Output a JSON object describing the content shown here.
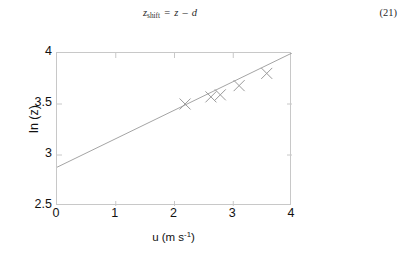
{
  "equation": {
    "variable": "z",
    "subscript": "shift",
    "equals": "=",
    "rhs_left": "z",
    "operator": "–",
    "rhs_right": "d",
    "full_text": "z_shift = z – d",
    "number": "(21)"
  },
  "chart_data": {
    "type": "scatter",
    "title": "",
    "xlabel": "u (m s-1)",
    "xlabel_base": "u (m s",
    "xlabel_exponent": "-1",
    "xlabel_tail": ")",
    "ylabel": "ln (z)",
    "xlim": [
      0,
      4
    ],
    "ylim": [
      2.5,
      4
    ],
    "xticks": [
      "0",
      "1",
      "2",
      "3",
      "4"
    ],
    "xtick_values": [
      0,
      1,
      2,
      3,
      4
    ],
    "yticks": [
      "2.5",
      "3",
      "3.5",
      "4"
    ],
    "ytick_values": [
      2.5,
      3,
      3.5,
      4
    ],
    "grid": false,
    "legend": false,
    "marker": "x",
    "marker_color": "#9a9a9a",
    "line_color": "#9a9a9a",
    "axis_color": "#c8c8c8",
    "series": [
      {
        "name": "measurements",
        "type": "scatter",
        "x": [
          2.18,
          2.62,
          2.78,
          3.1,
          3.57
        ],
        "y": [
          3.5,
          3.57,
          3.59,
          3.68,
          3.8
        ]
      },
      {
        "name": "fit-line",
        "type": "line",
        "x": [
          0,
          4
        ],
        "y": [
          2.88,
          4.0
        ],
        "slope": 0.28,
        "intercept": 2.88
      }
    ]
  }
}
